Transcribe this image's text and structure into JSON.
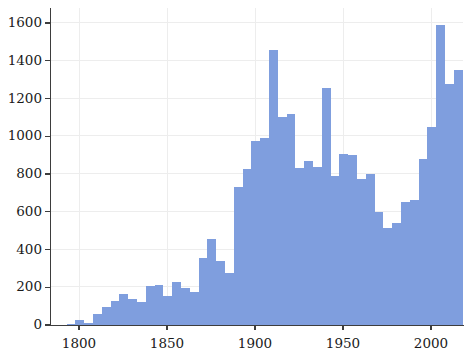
{
  "chart_data": {
    "type": "bar",
    "title": "",
    "subtitle": "",
    "xlabel": "",
    "ylabel": "",
    "xlim": [
      1793,
      2008
    ],
    "ylim": [
      0,
      1680
    ],
    "grid": true,
    "legend": null,
    "bar_color": "#7f9ede",
    "grid_color": "#ededed",
    "axis_color": "#3d3d3d",
    "background": "#ffffff",
    "bin_width": 5,
    "xticks": [
      1800,
      1850,
      1900,
      1950,
      2000
    ],
    "xtick_labels": [
      "1800",
      "1850",
      "1900",
      "1950",
      "2000"
    ],
    "yticks": [
      0,
      200,
      400,
      600,
      800,
      1000,
      1200,
      1400,
      1600
    ],
    "ytick_labels": [
      "0",
      "200",
      "400",
      "600",
      "800",
      "1000",
      "1200",
      "1400",
      "1600"
    ],
    "bins": [
      {
        "x0": 1793,
        "x1": 1798,
        "value": 8
      },
      {
        "x0": 1798,
        "x1": 1803,
        "value": 28
      },
      {
        "x0": 1803,
        "x1": 1808,
        "value": 10
      },
      {
        "x0": 1808,
        "x1": 1813,
        "value": 58
      },
      {
        "x0": 1813,
        "x1": 1818,
        "value": 95
      },
      {
        "x0": 1818,
        "x1": 1823,
        "value": 128
      },
      {
        "x0": 1823,
        "x1": 1828,
        "value": 163
      },
      {
        "x0": 1828,
        "x1": 1833,
        "value": 140
      },
      {
        "x0": 1833,
        "x1": 1838,
        "value": 120
      },
      {
        "x0": 1838,
        "x1": 1843,
        "value": 208
      },
      {
        "x0": 1843,
        "x1": 1848,
        "value": 210
      },
      {
        "x0": 1848,
        "x1": 1853,
        "value": 155
      },
      {
        "x0": 1853,
        "x1": 1858,
        "value": 228
      },
      {
        "x0": 1858,
        "x1": 1863,
        "value": 198
      },
      {
        "x0": 1863,
        "x1": 1868,
        "value": 173
      },
      {
        "x0": 1868,
        "x1": 1873,
        "value": 355
      },
      {
        "x0": 1873,
        "x1": 1878,
        "value": 455
      },
      {
        "x0": 1878,
        "x1": 1883,
        "value": 340
      },
      {
        "x0": 1883,
        "x1": 1888,
        "value": 275
      },
      {
        "x0": 1888,
        "x1": 1893,
        "value": 730
      },
      {
        "x0": 1893,
        "x1": 1898,
        "value": 825
      },
      {
        "x0": 1898,
        "x1": 1903,
        "value": 975
      },
      {
        "x0": 1903,
        "x1": 1908,
        "value": 990
      },
      {
        "x0": 1908,
        "x1": 1913,
        "value": 1455
      },
      {
        "x0": 1913,
        "x1": 1918,
        "value": 1100
      },
      {
        "x0": 1918,
        "x1": 1923,
        "value": 1120
      },
      {
        "x0": 1923,
        "x1": 1928,
        "value": 830
      },
      {
        "x0": 1928,
        "x1": 1933,
        "value": 870
      },
      {
        "x0": 1933,
        "x1": 1938,
        "value": 835
      },
      {
        "x0": 1938,
        "x1": 1943,
        "value": 1255
      },
      {
        "x0": 1943,
        "x1": 1948,
        "value": 790
      },
      {
        "x0": 1948,
        "x1": 1953,
        "value": 905
      },
      {
        "x0": 1953,
        "x1": 1958,
        "value": 900
      },
      {
        "x0": 1958,
        "x1": 1963,
        "value": 775
      },
      {
        "x0": 1963,
        "x1": 1968,
        "value": 800
      },
      {
        "x0": 1968,
        "x1": 1973,
        "value": 600
      },
      {
        "x0": 1973,
        "x1": 1978,
        "value": 515
      },
      {
        "x0": 1978,
        "x1": 1983,
        "value": 540
      },
      {
        "x0": 1983,
        "x1": 1988,
        "value": 650
      },
      {
        "x0": 1988,
        "x1": 1993,
        "value": 660
      },
      {
        "x0": 1993,
        "x1": 1998,
        "value": 880
      },
      {
        "x0": 1998,
        "x1": 2003,
        "value": 1050
      },
      {
        "x0": 2003,
        "x1": 2008,
        "value": 1590
      },
      {
        "x0": 2008,
        "x1": 2013,
        "value": 1275
      },
      {
        "x0": 2013,
        "x1": 2018,
        "value": 1350
      },
      {
        "x0": 2018,
        "x1": 2023,
        "value": 1275
      },
      {
        "x0": 2023,
        "x1": 2028,
        "value": 1125
      },
      {
        "x0": 2028,
        "x1": 2033,
        "value": 735
      },
      {
        "x0": 2033,
        "x1": 2038,
        "value": 780
      }
    ]
  }
}
